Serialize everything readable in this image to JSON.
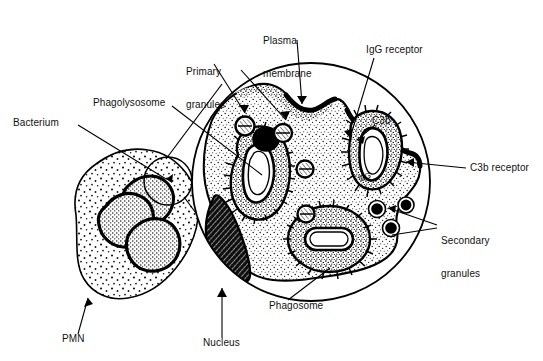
{
  "figure": {
    "background_color": "#ffffff",
    "ink_color": "#000000",
    "width": 543,
    "height": 361
  },
  "labels": {
    "primary_granules": "Primary\ngranules",
    "plasma_membrane": "Plasma\nmembrane",
    "igg_receptor": "IgG receptor",
    "c3b": "C3b",
    "c3b_receptor": "C3b receptor",
    "secondary_granules": "Secondary\ngranules",
    "phagolysosome": "Phagolysosome",
    "bacterium": "Bacterium",
    "phagosome": "Phagosome",
    "nucleus": "Nucleus",
    "pmn": "PMN",
    "igg_inline": "IgG"
  },
  "label_lines": {
    "primary_granules_line1": "Primary",
    "primary_granules_line2": "granules",
    "plasma_membrane_line1": "Plasma",
    "plasma_membrane_line2": "membrane",
    "secondary_granules_line1": "Secondary",
    "secondary_granules_line2": "granules"
  },
  "structures": {
    "pmn_cell": "polymorphonuclear-leukocyte",
    "magnified_circle": "magnified-cell-inset",
    "callout_circle": "callout-region-on-pmn",
    "nucleus_lobes_count": 3,
    "primary_granule_count": 4,
    "secondary_granule_count": 3,
    "phagosome_count": 1,
    "phagolysosome_count": 1,
    "engulfing_bacterium_count": 1
  }
}
